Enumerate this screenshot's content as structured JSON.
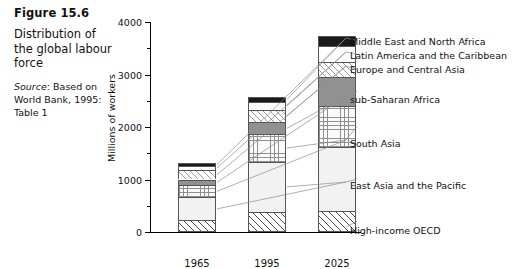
{
  "caption": {
    "figure_number": "Figure 15.6",
    "description": "Distribution of the global labour force",
    "source_label": "Source",
    "source_text": ": Based on World Bank, 1995: Table 1"
  },
  "chart_data": {
    "type": "bar",
    "stacked": true,
    "title": "Distribution of the global labour force",
    "xlabel": "",
    "ylabel": "Millions of workers",
    "ylim": [
      0,
      4000
    ],
    "yticks": [
      0,
      1000,
      2000,
      3000,
      4000
    ],
    "ytick_labels": [
      "0",
      "1000",
      "2000",
      "3000",
      "4000"
    ],
    "yminor_ticks": [
      500,
      1500,
      2500,
      3500
    ],
    "grid": false,
    "legend_position": "right",
    "categories": [
      "1965",
      "1995",
      "2025"
    ],
    "series": [
      {
        "name": "High-income OECD",
        "values": [
          220,
          380,
          400
        ]
      },
      {
        "name": "East Asia and the Pacific",
        "values": [
          440,
          960,
          1220
        ]
      },
      {
        "name": "South Asia",
        "values": [
          230,
          520,
          780
        ]
      },
      {
        "name": "sub-Saharan Africa",
        "values": [
          110,
          230,
          560
        ]
      },
      {
        "name": "Europe and Central Asia",
        "values": [
          180,
          240,
          270
        ]
      },
      {
        "name": "Latin America and the Caribbean",
        "values": [
          80,
          140,
          320
        ]
      },
      {
        "name": "Middle East and North Africa",
        "values": [
          50,
          110,
          190
        ]
      }
    ],
    "totals": [
      1310,
      2580,
      3740
    ]
  },
  "legend": {
    "items": [
      "Middle East and North Africa",
      "Latin America and the Caribbean",
      "Europe and Central Asia",
      "sub-Saharan Africa",
      "South Asia",
      "East Asia and the Pacific",
      "High-income OECD"
    ]
  },
  "colors": {
    "text": "#111111",
    "axis": "#000000",
    "mena": "#1a1a1a",
    "ssa": "#919191",
    "eap": "#f2f2f2"
  }
}
